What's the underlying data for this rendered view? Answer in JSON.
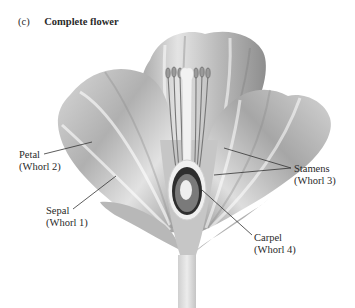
{
  "figure": {
    "panel_tag": "(c)",
    "title": "Complete flower"
  },
  "labels": [
    {
      "id": "petal",
      "name": "Petal",
      "whorl": "(Whorl 2)"
    },
    {
      "id": "sepal",
      "name": "Sepal",
      "whorl": "(Whorl 1)"
    },
    {
      "id": "stamens",
      "name": "Stamens",
      "whorl": "(Whorl 3)"
    },
    {
      "id": "carpel",
      "name": "Carpel",
      "whorl": "(Whorl 4)"
    }
  ],
  "colors": {
    "background": "#ffffff",
    "petal_light": "#e6e6e6",
    "petal_dark": "#9a9a9a",
    "carpel_dark": "#3a3a3a",
    "leader_line": "#333333"
  }
}
